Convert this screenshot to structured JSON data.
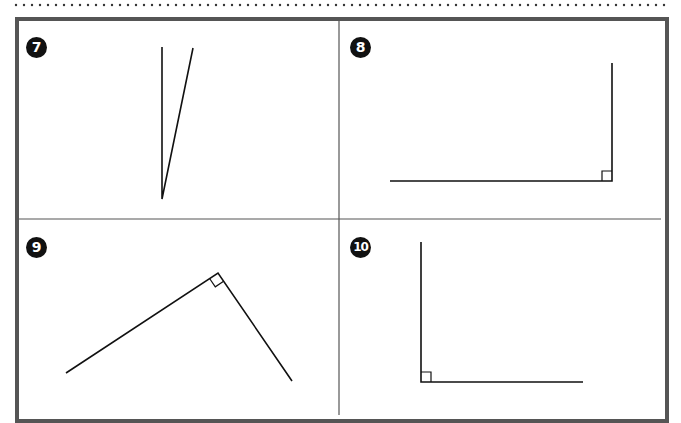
{
  "worksheet": {
    "panels": [
      {
        "number": "7",
        "angle": {
          "vertex": [
            162,
            199
          ],
          "arm1": [
            162,
            47
          ],
          "arm2": [
            193,
            48
          ],
          "right_angle_mark": false
        }
      },
      {
        "number": "8",
        "angle": {
          "vertex": [
            612,
            181
          ],
          "arm1": [
            390,
            181
          ],
          "arm2": [
            612,
            63
          ],
          "right_angle_mark": true
        }
      },
      {
        "number": "9",
        "angle": {
          "vertex": [
            218,
            273
          ],
          "arm1": [
            66,
            373
          ],
          "arm2": [
            292,
            381
          ],
          "right_angle_mark": true
        }
      },
      {
        "number": "10",
        "angle": {
          "vertex": [
            421,
            382
          ],
          "arm1": [
            421,
            242
          ],
          "arm2": [
            583,
            382
          ],
          "right_angle_mark": true
        }
      }
    ],
    "colors": {
      "frame": "#555555",
      "divider": "#555555",
      "line": "#111111",
      "badge": "#111111"
    }
  }
}
